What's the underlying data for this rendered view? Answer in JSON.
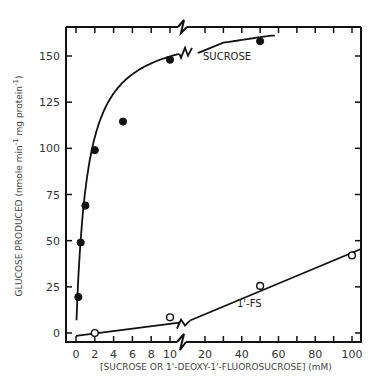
{
  "chart_data": {
    "type": "scatter",
    "title": "",
    "xlabel": "[SUCROSE OR 1'-DEOXY-1'-FLUOROSUCROSE] (mM)",
    "ylabel": "GLUCOSE PRODUCED (nmole min⁻¹ mg protein⁻¹)",
    "ylim": [
      0,
      165
    ],
    "x_axis_break": {
      "between": [
        10,
        20
      ],
      "left_segment": [
        0,
        11
      ],
      "right_segment": [
        11,
        100
      ]
    },
    "x_ticks_left": [
      0,
      2,
      4,
      6,
      8,
      10
    ],
    "x_ticks_right": [
      20,
      40,
      60,
      80,
      100
    ],
    "y_ticks": [
      0,
      25,
      50,
      75,
      100,
      125,
      150
    ],
    "grid": false,
    "legend": "inline labels",
    "series": [
      {
        "name": "SUCROSE",
        "marker": "filled-circle",
        "x": [
          0.25,
          0.5,
          1,
          2,
          5,
          10,
          50
        ],
        "y": [
          19.5,
          49,
          69,
          99,
          114.5,
          148,
          158
        ],
        "fit": "hyperbolic saturation curve"
      },
      {
        "name": "1'-FS",
        "marker": "open-circle",
        "x": [
          2,
          10,
          50,
          100
        ],
        "y": [
          0,
          8.5,
          25.5,
          42
        ],
        "fit": "linear"
      }
    ]
  },
  "labels": {
    "ylabel_main": "GLUCOSE PRODUCED (nmole min",
    "ylabel_sup1": "-1",
    "ylabel_mid": " mg protein",
    "ylabel_sup2": "-1",
    "ylabel_end": ")",
    "xlabel": "[SUCROSE OR 1'-DEOXY-1'-FLUOROSUCROSE] (mM)",
    "sucrose": "SUCROSE",
    "fs": "1'-FS"
  }
}
